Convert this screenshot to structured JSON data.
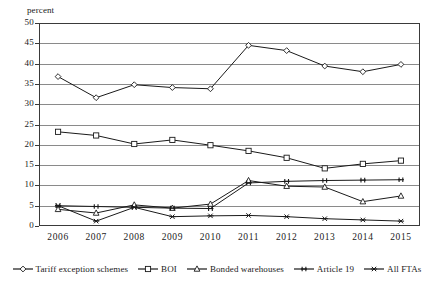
{
  "chart_data": {
    "type": "line",
    "title": "",
    "xlabel": "",
    "ylabel": "percent",
    "ylim": [
      0,
      50
    ],
    "ytick_step": 5,
    "grid": true,
    "legend_position": "bottom",
    "categories": [
      "2006",
      "2007",
      "2008",
      "2009",
      "2010",
      "2011",
      "2012",
      "2013",
      "2014",
      "2015"
    ],
    "yticks": [
      "0",
      "5",
      "10",
      "15",
      "20",
      "25",
      "30",
      "35",
      "40",
      "45",
      "50"
    ],
    "series": [
      {
        "name": "Tariff exception schemes",
        "marker": "diamond",
        "color": "#1a1a1a",
        "values": [
          36.8,
          31.6,
          34.8,
          34.1,
          33.8,
          44.5,
          43.2,
          39.4,
          38.0,
          39.8
        ]
      },
      {
        "name": "BOI",
        "marker": "square",
        "color": "#1a1a1a",
        "values": [
          23.2,
          22.3,
          20.2,
          21.2,
          19.9,
          18.5,
          16.8,
          14.2,
          15.3,
          16.1
        ]
      },
      {
        "name": "Bonded warehouses",
        "marker": "triangle",
        "color": "#1a1a1a",
        "values": [
          4.1,
          3.2,
          5.2,
          4.4,
          5.4,
          11.2,
          9.8,
          9.6,
          6.0,
          7.4
        ]
      },
      {
        "name": "Article 19",
        "marker": "cross-bar",
        "color": "#1a1a1a",
        "values": [
          5.0,
          4.8,
          4.6,
          4.4,
          4.3,
          10.6,
          11.0,
          11.2,
          11.3,
          11.4
        ]
      },
      {
        "name": "All FTAs",
        "marker": "star",
        "color": "#1a1a1a",
        "values": [
          5.0,
          1.2,
          4.6,
          2.3,
          2.5,
          2.6,
          2.3,
          1.8,
          1.5,
          1.2
        ]
      }
    ]
  },
  "axis": {
    "y_title": "percent"
  },
  "legend": {
    "items": [
      {
        "label": "Tariff exception schemes"
      },
      {
        "label": "BOI"
      },
      {
        "label": "Bonded warehouses"
      },
      {
        "label": "Article 19"
      },
      {
        "label": "All FTAs"
      }
    ]
  }
}
